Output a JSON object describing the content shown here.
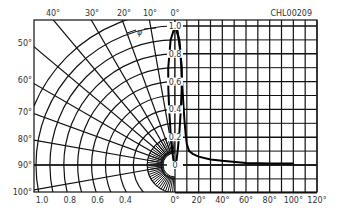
{
  "chart_data": {
    "type": "line",
    "title": "",
    "code_label": "CHL00209",
    "subplots": [
      {
        "name": "polar_radiation_pattern",
        "type": "polar",
        "description": "Relative radiant intensity vs angular displacement (polar)",
        "angle_ticks": [
          "0°",
          "10°",
          "20°",
          "30°",
          "40°",
          "50°",
          "60°",
          "70°",
          "80°",
          "90°",
          "100°"
        ],
        "radius_ticks": [
          "1.0",
          "0.8",
          "0.6",
          "0.4"
        ],
        "angle_symbol": "φ",
        "series": [
          {
            "name": "relative intensity",
            "angle_deg": [
              0,
              2,
              4,
              5,
              6,
              8,
              10,
              15,
              20,
              30,
              90
            ],
            "value": [
              1.0,
              0.9,
              0.7,
              0.55,
              0.4,
              0.22,
              0.12,
              0.05,
              0.03,
              0.02,
              0.0
            ]
          }
        ]
      },
      {
        "name": "cartesian_radiation_pattern",
        "type": "line",
        "xlabel": "",
        "ylabel": "",
        "x_ticks": [
          "0°",
          "20°",
          "40°",
          "60°",
          "80°",
          "100°",
          "120°"
        ],
        "y_ticks": [
          "0",
          "0.2",
          "0.4",
          "0.6",
          "0.8",
          "1.0"
        ],
        "xlim": [
          0,
          120
        ],
        "ylim": [
          0,
          1.0
        ],
        "grid": true,
        "series": [
          {
            "name": "relative intensity",
            "x": [
              0,
              2,
              4,
              5,
              6,
              7,
              8,
              9,
              10,
              12,
              15,
              20,
              30,
              40,
              60,
              80,
              100
            ],
            "y": [
              1.0,
              0.97,
              0.85,
              0.75,
              0.6,
              0.45,
              0.32,
              0.22,
              0.15,
              0.1,
              0.08,
              0.06,
              0.04,
              0.03,
              0.015,
              0.01,
              0.01
            ]
          }
        ]
      }
    ]
  }
}
